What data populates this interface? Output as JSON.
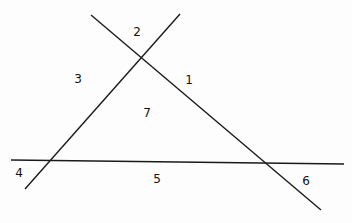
{
  "diagram": {
    "line_color": "#1a1a1a",
    "lines": [
      {
        "id": "left-diagonal",
        "x1": 25,
        "y1": 189,
        "x2": 180,
        "y2": 14
      },
      {
        "id": "right-diagonal",
        "x1": 91,
        "y1": 15,
        "x2": 321,
        "y2": 210
      },
      {
        "id": "horizontal",
        "x1": 11,
        "y1": 160,
        "x2": 344,
        "y2": 164
      }
    ],
    "regions": [
      {
        "label": "1",
        "x": 189,
        "y": 80
      },
      {
        "label": "2",
        "x": 137,
        "y": 32
      },
      {
        "label": "3",
        "x": 78,
        "y": 79
      },
      {
        "label": "4",
        "x": 19,
        "y": 173
      },
      {
        "label": "5",
        "x": 157,
        "y": 179
      },
      {
        "label": "6",
        "x": 306,
        "y": 181
      },
      {
        "label": "7",
        "x": 147,
        "y": 113
      }
    ]
  }
}
